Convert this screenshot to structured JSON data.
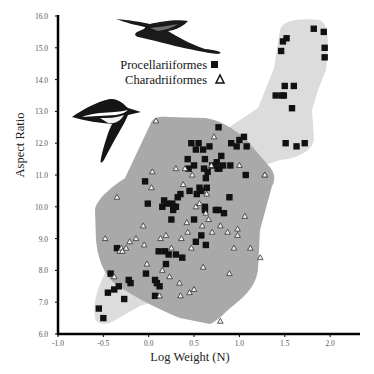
{
  "chart_data": {
    "type": "scatter",
    "title": "",
    "xlabel": "Log Weight (N)",
    "ylabel": "Aspect Ratio",
    "xlim": [
      -1.0,
      2.3
    ],
    "ylim": [
      6.0,
      16.0
    ],
    "x_ticks": [
      "-1.0",
      "-0.5",
      "0.0",
      "0.5",
      "1.0",
      "1.5",
      "2.0"
    ],
    "y_ticks": [
      "6.0",
      "7.0",
      "8.0",
      "9.0",
      "10.0",
      "11.0",
      "12.0",
      "13.0",
      "14.0",
      "15.0",
      "16.0"
    ],
    "grid": false,
    "legend": {
      "position": "upper-center",
      "entries": [
        {
          "label": "Procellariiformes",
          "marker": "filled-square"
        },
        {
          "label": "Charadriiformes",
          "marker": "open-triangle"
        }
      ]
    },
    "regions": [
      {
        "name": "Procellariiformes envelope",
        "color": "#dcdcdc"
      },
      {
        "name": "Charadriiformes envelope",
        "color": "#a8a8a8"
      }
    ],
    "series": [
      {
        "name": "Procellariiformes",
        "marker": "square",
        "points": [
          [
            -0.55,
            6.8
          ],
          [
            -0.5,
            6.5
          ],
          [
            -0.45,
            7.3
          ],
          [
            -0.42,
            7.9
          ],
          [
            -0.38,
            7.4
          ],
          [
            -0.35,
            8.7
          ],
          [
            -0.33,
            7.5
          ],
          [
            -0.27,
            7.1
          ],
          [
            -0.22,
            7.7
          ],
          [
            -0.2,
            7.6
          ],
          [
            -0.04,
            10.8
          ],
          [
            -0.03,
            7.9
          ],
          [
            -0.01,
            10.1
          ],
          [
            0.07,
            7.7
          ],
          [
            0.07,
            7.2
          ],
          [
            0.09,
            7.6
          ],
          [
            0.11,
            8.6
          ],
          [
            0.12,
            7.5
          ],
          [
            0.15,
            10.0
          ],
          [
            0.17,
            10.2
          ],
          [
            0.18,
            8.6
          ],
          [
            0.19,
            8.2
          ],
          [
            0.2,
            10.1
          ],
          [
            0.22,
            8.5
          ],
          [
            0.25,
            9.6
          ],
          [
            0.26,
            10.1
          ],
          [
            0.27,
            9.9
          ],
          [
            0.28,
            10.0
          ],
          [
            0.3,
            8.5
          ],
          [
            0.3,
            10.0
          ],
          [
            0.32,
            10.3
          ],
          [
            0.35,
            10.4
          ],
          [
            0.37,
            8.4
          ],
          [
            0.43,
            11.5
          ],
          [
            0.44,
            11.2
          ],
          [
            0.45,
            10.5
          ],
          [
            0.47,
            12.0
          ],
          [
            0.5,
            11.3
          ],
          [
            0.5,
            9.6
          ],
          [
            0.52,
            11.8
          ],
          [
            0.52,
            8.9
          ],
          [
            0.53,
            10.4
          ],
          [
            0.55,
            12.0
          ],
          [
            0.56,
            10.6
          ],
          [
            0.58,
            10.5
          ],
          [
            0.58,
            9.1
          ],
          [
            0.6,
            11.8
          ],
          [
            0.61,
            11.2
          ],
          [
            0.62,
            10.0
          ],
          [
            0.62,
            9.9
          ],
          [
            0.62,
            11.5
          ],
          [
            0.63,
            8.8
          ],
          [
            0.63,
            10.9
          ],
          [
            0.64,
            10.6
          ],
          [
            0.65,
            11.1
          ],
          [
            0.67,
            11.9
          ],
          [
            0.7,
            11.3
          ],
          [
            0.74,
            9.9
          ],
          [
            0.75,
            11.4
          ],
          [
            0.76,
            11.2
          ],
          [
            0.77,
            12.5
          ],
          [
            0.77,
            9.9
          ],
          [
            0.78,
            11.2
          ],
          [
            0.8,
            11.6
          ],
          [
            0.82,
            11.3
          ],
          [
            0.83,
            9.8
          ],
          [
            0.89,
            10.3
          ],
          [
            0.9,
            11.3
          ],
          [
            0.91,
            12.0
          ],
          [
            0.97,
            11.9
          ],
          [
            1.0,
            12.1
          ],
          [
            1.05,
            12.2
          ],
          [
            1.07,
            11.0
          ],
          [
            1.08,
            11.9
          ],
          [
            1.4,
            13.5
          ],
          [
            1.46,
            14.9
          ],
          [
            1.47,
            13.5
          ],
          [
            1.48,
            15.2
          ],
          [
            1.49,
            13.5
          ],
          [
            1.5,
            13.8
          ],
          [
            1.51,
            12.0
          ],
          [
            1.52,
            15.3
          ],
          [
            1.58,
            13.1
          ],
          [
            1.6,
            13.8
          ],
          [
            1.63,
            11.9
          ],
          [
            1.72,
            12.0
          ],
          [
            1.82,
            15.6
          ],
          [
            1.93,
            15.5
          ],
          [
            1.94,
            15.0
          ],
          [
            1.94,
            14.7
          ]
        ]
      },
      {
        "name": "Charadriiformes",
        "marker": "triangle",
        "points": [
          [
            -0.48,
            9.0
          ],
          [
            -0.38,
            7.8
          ],
          [
            -0.35,
            10.3
          ],
          [
            -0.32,
            8.6
          ],
          [
            -0.3,
            8.7
          ],
          [
            -0.29,
            8.6
          ],
          [
            -0.25,
            8.7
          ],
          [
            -0.21,
            8.9
          ],
          [
            -0.14,
            9.0
          ],
          [
            -0.06,
            9.4
          ],
          [
            -0.05,
            8.8
          ],
          [
            -0.02,
            8.2
          ],
          [
            0.03,
            10.6
          ],
          [
            0.04,
            11.1
          ],
          [
            0.08,
            12.7
          ],
          [
            0.12,
            7.2
          ],
          [
            0.13,
            9.0
          ],
          [
            0.15,
            8.0
          ],
          [
            0.19,
            9.1
          ],
          [
            0.23,
            7.8
          ],
          [
            0.25,
            8.7
          ],
          [
            0.3,
            11.2
          ],
          [
            0.34,
            7.6
          ],
          [
            0.35,
            7.2
          ],
          [
            0.36,
            9.0
          ],
          [
            0.38,
            10.7
          ],
          [
            0.4,
            11.2
          ],
          [
            0.42,
            9.5
          ],
          [
            0.43,
            9.2
          ],
          [
            0.45,
            7.3
          ],
          [
            0.47,
            8.7
          ],
          [
            0.48,
            11.0
          ],
          [
            0.5,
            7.4
          ],
          [
            0.52,
            10.0
          ],
          [
            0.56,
            10.1
          ],
          [
            0.59,
            9.4
          ],
          [
            0.6,
            8.1
          ],
          [
            0.63,
            9.8
          ],
          [
            0.64,
            10.4
          ],
          [
            0.66,
            9.6
          ],
          [
            0.69,
            11.3
          ],
          [
            0.7,
            9.2
          ],
          [
            0.72,
            12.2
          ],
          [
            0.79,
            9.4
          ],
          [
            0.79,
            6.4
          ],
          [
            0.87,
            9.2
          ],
          [
            0.89,
            7.9
          ],
          [
            0.94,
            8.7
          ],
          [
            0.98,
            9.3
          ],
          [
            0.98,
            9.1
          ],
          [
            1.0,
            11.3
          ],
          [
            1.06,
            9.7
          ],
          [
            1.12,
            8.7
          ],
          [
            1.23,
            8.4
          ],
          [
            1.28,
            11.0
          ],
          [
            1.28,
            11.0
          ]
        ]
      }
    ]
  }
}
